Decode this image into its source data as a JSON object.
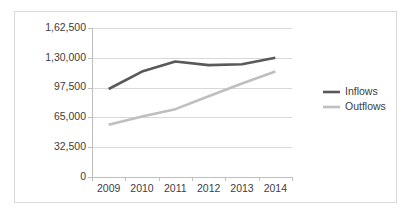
{
  "chart_data": {
    "type": "line",
    "title": "",
    "xlabel": "",
    "ylabel": "",
    "categories": [
      "2009",
      "2010",
      "2011",
      "2012",
      "2013",
      "2014"
    ],
    "ylim": [
      0,
      162500
    ],
    "ytick_values": [
      0,
      32500,
      65000,
      97500,
      130000,
      162500
    ],
    "ytick_labels": [
      "0",
      "32,500",
      "65,000",
      "97,500",
      "1,30,000",
      "1,62,500"
    ],
    "grid": true,
    "legend_position": "right",
    "series": [
      {
        "name": "Inflows",
        "color": "#595959",
        "values": [
          96000,
          115000,
          126000,
          122000,
          123000,
          130000
        ]
      },
      {
        "name": "Outflows",
        "color": "#bfbfbf",
        "values": [
          57000,
          66000,
          74000,
          88000,
          102000,
          115000
        ]
      }
    ]
  },
  "legend": {
    "items": [
      {
        "label": "Inflows",
        "color": "#595959"
      },
      {
        "label": "Outflows",
        "color": "#bfbfbf"
      }
    ]
  },
  "colors": {
    "inflows": "#595959",
    "outflows": "#bfbfbf",
    "gridline": "#d9d9d9",
    "axis": "#bfbfbf",
    "text": "#404040",
    "frame": "#d9d9d9",
    "background": "#ffffff"
  }
}
